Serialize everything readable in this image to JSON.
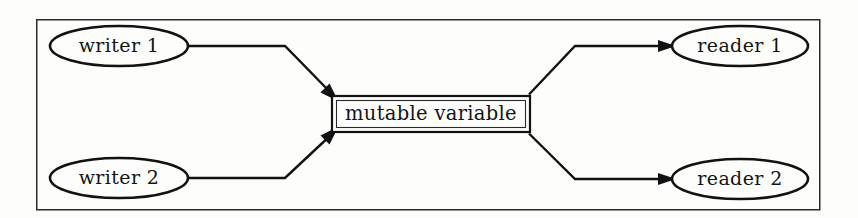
{
  "figure": {
    "background_color": "#fdfdfc",
    "line_color": "#121212",
    "frame_color": "#2b2b2b"
  },
  "frame": {
    "name": "diagram-frame",
    "x": 36,
    "y": 19,
    "width": 784,
    "height": 191
  },
  "nodes": {
    "writer_1": {
      "label": "writer 1",
      "shape": "ellipse",
      "cx": 119,
      "cy": 46,
      "rx": 69,
      "ry": 20
    },
    "writer_2": {
      "label": "writer 2",
      "shape": "ellipse",
      "cx": 119,
      "cy": 178,
      "rx": 69,
      "ry": 20
    },
    "reader_1": {
      "label": "reader 1",
      "shape": "ellipse",
      "cx": 740,
      "cy": 46,
      "rx": 68,
      "ry": 20
    },
    "reader_2": {
      "label": "reader 2",
      "shape": "ellipse",
      "cx": 740,
      "cy": 179,
      "rx": 68,
      "ry": 20
    },
    "mutable_variable": {
      "label": "mutable variable",
      "shape": "rectangle",
      "x": 332,
      "y": 96,
      "width": 198,
      "height": 36
    }
  },
  "edges": [
    {
      "name": "writer-1-to-variable",
      "from": "writer 1",
      "to": "mutable variable",
      "direction": "to-variable",
      "points": "188,46 285,46 336,98"
    },
    {
      "name": "writer-2-to-variable",
      "from": "writer 2",
      "to": "mutable variable",
      "direction": "to-variable",
      "points": "188,178 285,178 336,130"
    },
    {
      "name": "variable-to-reader-1",
      "from": "mutable variable",
      "to": "reader 1",
      "direction": "from-variable",
      "points": "527,98 575,46 672,46"
    },
    {
      "name": "variable-to-reader-2",
      "from": "mutable variable",
      "to": "reader 2",
      "direction": "from-variable",
      "points": "527,130 575,179 672,179"
    }
  ],
  "legend": {
    "writers_count": "2",
    "readers_count": "2"
  }
}
